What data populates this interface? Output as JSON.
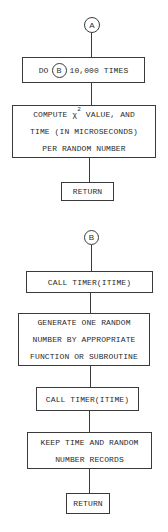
{
  "diagram_a": {
    "connector": "A",
    "loop_box": {
      "prefix": "DO",
      "inner_connector": "B",
      "suffix": "10,000 TIMES"
    },
    "compute_box": {
      "line1_pre": "COMPUTE χ",
      "line1_sup": "2",
      "line1_post": " VALUE, AND",
      "line2": "TIME (IN MICROSECONDS)",
      "line3": "PER RANDOM NUMBER"
    },
    "return_box": "RETURN"
  },
  "diagram_b": {
    "connector": "B",
    "timer_box_1": "CALL TIMER(ITIME)",
    "generate_box": {
      "line1": "GENERATE ONE RANDOM",
      "line2": "NUMBER BY APPROPRIATE",
      "line3": "FUNCTION OR SUBROUTINE"
    },
    "timer_box_2": "CALL TIMER(ITIME)",
    "records_box": {
      "line1": "KEEP TIME AND RANDOM",
      "line2": "NUMBER RECORDS"
    },
    "return_box": "RETURN"
  }
}
